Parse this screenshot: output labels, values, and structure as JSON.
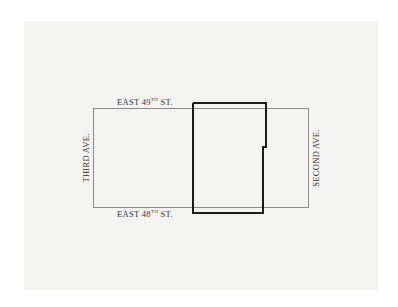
{
  "map": {
    "streets": {
      "north": {
        "name": "EAST 49",
        "suffix": "TH",
        "type": "ST."
      },
      "south": {
        "name": "EAST 48",
        "suffix": "TH",
        "type": "ST."
      },
      "west": "THIRD AVE.",
      "east": "SECOND AVE."
    },
    "colors": {
      "background": "#f3f3f2",
      "block_outline": "#8a8a8a",
      "site_outline": "#1a1a1a",
      "text": "#333333"
    }
  }
}
